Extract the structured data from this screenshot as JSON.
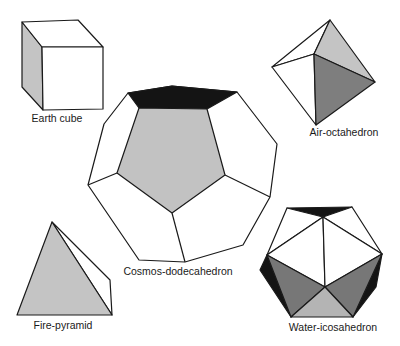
{
  "diagram": {
    "colors": {
      "background": "#ffffff",
      "line": "#1a1a1a",
      "light_grey": "#c4c4c4",
      "mid_grey": "#a8a8a8",
      "dark_grey": "#7a7a7a",
      "black": "#141414",
      "white_face": "#ffffff"
    },
    "solids": [
      {
        "id": "cube",
        "label": "Earth cube",
        "element": "Earth",
        "shape": "cube"
      },
      {
        "id": "octahedron",
        "label": "Air-octahedron",
        "element": "Air",
        "shape": "octahedron"
      },
      {
        "id": "dodecahedron",
        "label": "Cosmos-dodecahedron",
        "element": "Cosmos",
        "shape": "dodecahedron"
      },
      {
        "id": "pyramid",
        "label": "Fire-pyramid",
        "element": "Fire",
        "shape": "tetrahedron"
      },
      {
        "id": "icosahedron",
        "label": "Water-icosahedron",
        "element": "Water",
        "shape": "icosahedron"
      }
    ]
  }
}
